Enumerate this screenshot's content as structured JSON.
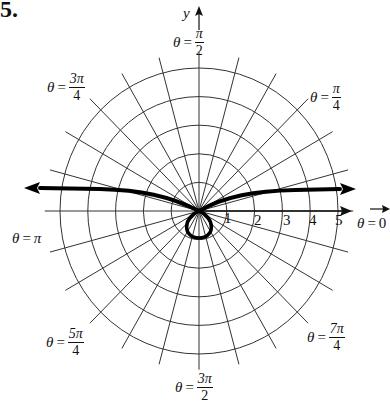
{
  "problem": {
    "number": "5."
  },
  "axes": {
    "y_label": "y",
    "x_label": "x"
  },
  "angle_labels": {
    "pi_over_2": {
      "theta": "θ",
      "eq": "=",
      "num": "π",
      "den": "2"
    },
    "pi_over_4": {
      "theta": "θ",
      "eq": "=",
      "num": "π",
      "den": "4"
    },
    "three_pi_4": {
      "theta": "θ",
      "eq": "=",
      "num": "3π",
      "den": "4"
    },
    "pi": {
      "theta": "θ",
      "eq": "=",
      "value": "π"
    },
    "zero": {
      "theta": "θ",
      "eq": "=",
      "value": "0"
    },
    "five_pi_4": {
      "theta": "θ",
      "eq": "=",
      "num": "5π",
      "den": "4"
    },
    "seven_pi_4": {
      "theta": "θ",
      "eq": "=",
      "num": "7π",
      "den": "4"
    },
    "three_pi_2": {
      "theta": "θ",
      "eq": "=",
      "num": "3π",
      "den": "2"
    }
  },
  "radial_ticks": [
    "1",
    "2",
    "3",
    "4",
    "5"
  ],
  "colors": {
    "grid": "#333333",
    "curve": "#000000",
    "background": "#ffffff"
  },
  "chart_data": {
    "type": "polar",
    "title": "",
    "grid": {
      "circles": [
        1,
        2,
        3,
        4,
        5
      ],
      "radial_spacing_deg": 15,
      "radial_lines": 24
    },
    "axis_labels": [
      "θ = 0",
      "θ = π/4",
      "θ = π/2",
      "θ = 3π/4",
      "θ = π",
      "θ = 5π/4",
      "θ = 3π/2",
      "θ = 7π/4"
    ],
    "r_ticks": [
      1,
      2,
      3,
      4,
      5
    ],
    "curve": {
      "description": "Curve with an inner loop below the pole and two branches extending left and right with arrowheads (asymptotic behavior)",
      "inner_loop": {
        "bottom_r": 1.0,
        "angle": "3π/2"
      },
      "branches": [
        {
          "direction": "left",
          "ends_near": {
            "x": -6.1,
            "y": 0.8
          }
        },
        {
          "direction": "right",
          "ends_near": {
            "x": 5.6,
            "y": 0.8
          }
        }
      ]
    }
  }
}
